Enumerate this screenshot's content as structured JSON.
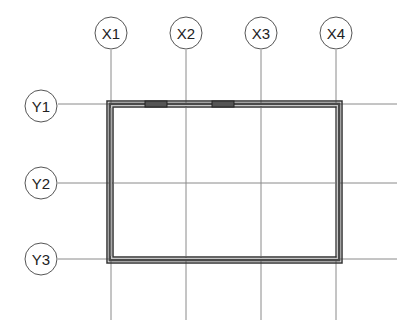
{
  "drawing": {
    "type": "floor-plan-grid",
    "grid_x": [
      {
        "label": "X1",
        "x": 111
      },
      {
        "label": "X2",
        "x": 186
      },
      {
        "label": "X3",
        "x": 261
      },
      {
        "label": "X4",
        "x": 336
      }
    ],
    "grid_y": [
      {
        "label": "Y1",
        "y": 104
      },
      {
        "label": "Y2",
        "y": 183
      },
      {
        "label": "Y3",
        "y": 259
      }
    ],
    "walls": {
      "left": 107,
      "top": 101,
      "right": 342,
      "bottom": 263,
      "thickness": 6
    },
    "windows": [
      {
        "x1": 145,
        "x2": 167
      },
      {
        "x1": 212,
        "x2": 234
      }
    ],
    "colors": {
      "grid_line": "#888888",
      "wall": "#3a3a3a",
      "wall_inner": "#bdbdbd",
      "bubble_stroke": "#555555"
    }
  }
}
